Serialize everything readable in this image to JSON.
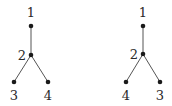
{
  "diagram": {
    "type": "tree-pair",
    "trees": [
      {
        "name": "left-tree",
        "nodes": [
          {
            "id": "1",
            "label": "1",
            "x": 31,
            "y": 26,
            "lx": 31,
            "ly": 17,
            "anchor": "middle"
          },
          {
            "id": "2",
            "label": "2",
            "x": 31,
            "y": 55,
            "lx": 22,
            "ly": 60,
            "anchor": "middle"
          },
          {
            "id": "3",
            "label": "3",
            "x": 14,
            "y": 82,
            "lx": 14,
            "ly": 100,
            "anchor": "middle"
          },
          {
            "id": "4",
            "label": "4",
            "x": 48,
            "y": 82,
            "lx": 48,
            "ly": 100,
            "anchor": "middle"
          }
        ],
        "edges": [
          [
            "1",
            "2"
          ],
          [
            "2",
            "3"
          ],
          [
            "2",
            "4"
          ]
        ]
      },
      {
        "name": "right-tree",
        "nodes": [
          {
            "id": "1",
            "label": "1",
            "x": 143,
            "y": 26,
            "lx": 143,
            "ly": 17,
            "anchor": "middle"
          },
          {
            "id": "2",
            "label": "2",
            "x": 143,
            "y": 54,
            "lx": 134,
            "ly": 59,
            "anchor": "middle"
          },
          {
            "id": "4",
            "label": "4",
            "x": 126,
            "y": 82,
            "lx": 126,
            "ly": 100,
            "anchor": "middle"
          },
          {
            "id": "3",
            "label": "3",
            "x": 160,
            "y": 82,
            "lx": 160,
            "ly": 100,
            "anchor": "middle"
          }
        ],
        "edges": [
          [
            "1",
            "2"
          ],
          [
            "2",
            "4"
          ],
          [
            "2",
            "3"
          ]
        ]
      }
    ],
    "colors": {
      "node": "#1a1a1a",
      "edge": "#555555",
      "label": "#2a2a2a",
      "background": "#ffffff"
    }
  }
}
